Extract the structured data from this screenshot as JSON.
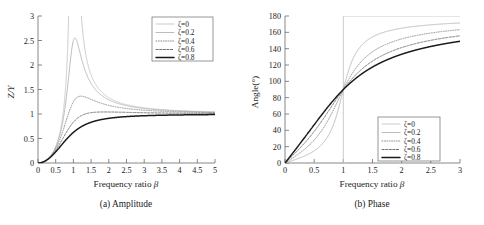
{
  "figure": {
    "panels": [
      {
        "id": "amplitude",
        "caption": "(a) Amplitude",
        "xlabel_text": "Frequency ratio ",
        "xlabel_symbol": "β",
        "ylabel": "Z/Y",
        "xticks": [
          "0",
          "0.5",
          "1",
          "1.5",
          "2",
          "2.5",
          "3",
          "3.5",
          "4",
          "4.5",
          "5"
        ],
        "yticks": [
          "0",
          "0.5",
          "1",
          "1.5",
          "2",
          "2.5",
          "3"
        ],
        "legend": [
          "ζ=0",
          "ζ=0.2",
          "ζ=0.4",
          "ζ=0.6",
          "ζ=0.8"
        ]
      },
      {
        "id": "phase",
        "caption": "(b) Phase",
        "xlabel_text": "Frequency ratio ",
        "xlabel_symbol": "β",
        "ylabel": "Angle(°)",
        "xticks": [
          "0",
          "0.5",
          "1",
          "1.5",
          "2",
          "2.5",
          "3"
        ],
        "yticks": [
          "0",
          "20",
          "40",
          "60",
          "80",
          "100",
          "120",
          "140",
          "160",
          "180"
        ],
        "legend": [
          "ζ=0",
          "ζ=0.2",
          "ζ=0.4",
          "ζ=0.6",
          "ζ=0.8"
        ]
      }
    ]
  },
  "chart_data": [
    {
      "type": "line",
      "id": "amplitude",
      "title": "(a) Amplitude",
      "xlabel": "Frequency ratio β",
      "ylabel": "Z/Y",
      "xlim": [
        0,
        5
      ],
      "ylim": [
        0,
        3
      ],
      "xticks": [
        0,
        0.5,
        1,
        1.5,
        2,
        2.5,
        3,
        3.5,
        4,
        4.5,
        5
      ],
      "yticks": [
        0,
        0.5,
        1,
        1.5,
        2,
        2.5,
        3
      ],
      "grid": false,
      "legend_position": "top-right",
      "formula": "Z/Y = beta^2 / sqrt((1-beta^2)^2 + (2*zeta*beta)^2)",
      "series": [
        {
          "name": "ζ=0",
          "zeta": 0.0,
          "style": "solid-light",
          "x": [
            0,
            0.25,
            0.5,
            0.75,
            0.9,
            0.95,
            1.0,
            1.05,
            1.1,
            1.25,
            1.5,
            2,
            2.5,
            3,
            3.5,
            4,
            4.5,
            5
          ],
          "y": [
            0,
            0.067,
            0.333,
            1.286,
            4.263,
            9.103,
            null,
            10.244,
            5.238,
            2.778,
            1.8,
            1.333,
            1.19,
            1.125,
            1.089,
            1.067,
            1.052,
            1.042
          ]
        },
        {
          "name": "ζ=0.2",
          "zeta": 0.2,
          "style": "solid-gray",
          "x": [
            0,
            0.25,
            0.5,
            0.75,
            0.9,
            1.0,
            1.05,
            1.1,
            1.25,
            1.5,
            2,
            2.5,
            3,
            3.5,
            4,
            4.5,
            5
          ],
          "y": [
            0,
            0.067,
            0.327,
            1.121,
            2.074,
            2.5,
            2.478,
            2.245,
            1.639,
            1.309,
            1.115,
            1.063,
            1.039,
            1.027,
            1.019,
            1.014,
            1.011
          ]
        },
        {
          "name": "ζ=0.4",
          "zeta": 0.4,
          "style": "dotted",
          "x": [
            0,
            0.25,
            0.5,
            0.75,
            1.0,
            1.15,
            1.25,
            1.5,
            2,
            2.5,
            3,
            3.5,
            4,
            4.5,
            5
          ],
          "y": [
            0,
            0.066,
            0.309,
            0.866,
            1.25,
            1.354,
            1.348,
            1.203,
            1.054,
            1.018,
            1.007,
            1.002,
            1.0,
            0.999,
            0.999
          ]
        },
        {
          "name": "ζ=0.6",
          "zeta": 0.6,
          "style": "dashed",
          "x": [
            0,
            0.25,
            0.5,
            0.75,
            1.0,
            1.25,
            1.5,
            1.75,
            2,
            2.5,
            3,
            3.5,
            4,
            4.5,
            5
          ],
          "y": [
            0,
            0.065,
            0.284,
            0.7,
            0.833,
            0.972,
            1.004,
            1.01,
            1.007,
            0.998,
            0.994,
            0.993,
            0.993,
            0.994,
            0.995
          ]
        },
        {
          "name": "ζ=0.8",
          "zeta": 0.8,
          "style": "solid-black",
          "x": [
            0,
            0.25,
            0.5,
            0.75,
            1.0,
            1.25,
            1.5,
            1.75,
            2,
            2.5,
            3,
            3.5,
            4,
            4.5,
            5
          ],
          "y": [
            0,
            0.063,
            0.255,
            0.536,
            0.625,
            0.781,
            0.857,
            0.9,
            0.925,
            0.954,
            0.969,
            0.977,
            0.983,
            0.986,
            0.989
          ]
        }
      ]
    },
    {
      "type": "line",
      "id": "phase",
      "title": "(b) Phase",
      "xlabel": "Frequency ratio β",
      "ylabel": "Angle(°)",
      "xlim": [
        0,
        3
      ],
      "ylim": [
        0,
        180
      ],
      "xticks": [
        0,
        0.5,
        1,
        1.5,
        2,
        2.5,
        3
      ],
      "yticks": [
        0,
        20,
        40,
        60,
        80,
        100,
        120,
        140,
        160,
        180
      ],
      "grid": false,
      "legend_position": "bottom-right",
      "formula": "phi = atan2(2*zeta*beta, 1-beta^2) degrees",
      "series": [
        {
          "name": "ζ=0",
          "zeta": 0.0,
          "style": "solid-light",
          "x": [
            0,
            0.5,
            0.99,
            1.0,
            1.01,
            1.5,
            2,
            2.5,
            3
          ],
          "y": [
            0,
            0,
            0,
            90,
            180,
            180,
            180,
            180,
            180
          ]
        },
        {
          "name": "ζ=0.2",
          "zeta": 0.2,
          "style": "solid-gray",
          "x": [
            0,
            0.25,
            0.5,
            0.75,
            0.9,
            1.0,
            1.1,
            1.25,
            1.5,
            2,
            2.5,
            3
          ],
          "y": [
            0,
            5.7,
            14.9,
            31.2,
            62.2,
            90,
            133.4,
            155.0,
            166.0,
            172.4,
            175.0,
            176.2
          ]
        },
        {
          "name": "ζ=0.4",
          "zeta": 0.4,
          "style": "dotted",
          "x": [
            0,
            0.25,
            0.5,
            0.75,
            0.9,
            1.0,
            1.1,
            1.25,
            1.5,
            2,
            2.5,
            3
          ],
          "y": [
            0,
            11.3,
            28.1,
            52.4,
            75.6,
            90,
            115.8,
            139.4,
            152.0,
            161.6,
            166.6,
            169.6
          ]
        },
        {
          "name": "ζ=0.6",
          "zeta": 0.6,
          "style": "dashed",
          "x": [
            0,
            0.25,
            0.5,
            0.75,
            0.9,
            1.0,
            1.1,
            1.25,
            1.5,
            2,
            2.5,
            3
          ],
          "y": [
            0,
            16.7,
            38.7,
            64.1,
            79.4,
            90,
            107.0,
            128.0,
            143.1,
            155.3,
            161.0,
            164.1
          ]
        },
        {
          "name": "ζ=0.8",
          "zeta": 0.8,
          "style": "solid-black",
          "x": [
            0,
            0.25,
            0.5,
            0.75,
            0.9,
            1.0,
            1.1,
            1.25,
            1.5,
            2,
            2.5,
            3
          ],
          "y": [
            0,
            21.8,
            46.8,
            70.8,
            81.3,
            90,
            103.0,
            120.5,
            136.1,
            150.3,
            157.0,
            160.8
          ]
        }
      ]
    }
  ]
}
